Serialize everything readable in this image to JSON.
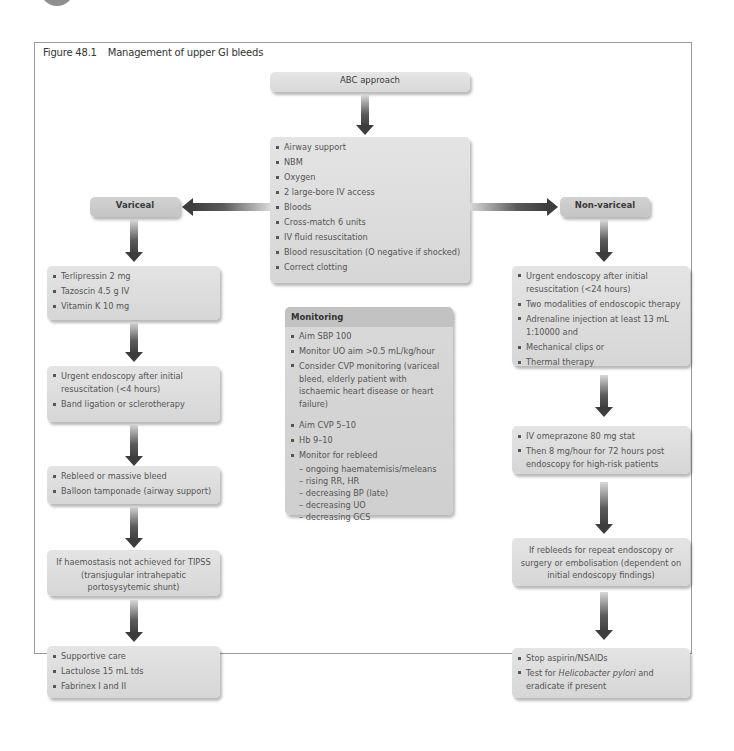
{
  "figure": {
    "number": "Figure 48.1",
    "title": "Management of upper GI bleeds"
  },
  "abc": {
    "title": "ABC approach",
    "items": [
      "Airway support",
      "NBM",
      "Oxygen",
      "2 large-bore IV access",
      "Bloods",
      "Cross-match 6 units",
      "IV fluid resuscitation",
      "Blood resuscitation (O negative if shocked)",
      "Correct clotting"
    ]
  },
  "variceal": {
    "title": "Variceal",
    "step1": [
      "Terlipressin 2 mg",
      "Tazoscin 4.5 g IV",
      "Vitamin K 10 mg"
    ],
    "step2": [
      "Urgent endoscopy after initial resuscitation (<4 hours)",
      "Band ligation or sclerotherapy"
    ],
    "step3": [
      "Rebleed or massive bleed",
      "Balloon tamponade (airway support)"
    ],
    "step4": "If haemostasis not achieved for TIPSS (transjugular intrahepatic portosysytemic shunt)",
    "step5": [
      "Supportive care",
      "Lactulose 15 mL tds",
      "Fabrinex I and II"
    ]
  },
  "monitoring": {
    "title": "Monitoring",
    "items": [
      "Aim SBP 100",
      "Monitor UO aim >0.5 mL/kg/hour",
      "Consider CVP monitoring (variceal bleed, elderly patient with ischaemic heart disease or heart failure)",
      "Aim CVP 5–10",
      "Hb 9–10",
      "Monitor for rebleed"
    ],
    "rebleed_signs": [
      "– ongoing haematemisis/meleans",
      "– rising RR, HR",
      "– decreasing BP (late)",
      "– decreasing UO",
      "– decreasing GCS"
    ]
  },
  "non_variceal": {
    "title": "Non-variceal",
    "step1": [
      "Urgent endoscopy after initial resuscitation (<24 hours)",
      "Two modalities of endoscopic therapy",
      "Adrenaline injection at least 13 mL 1:10000 and",
      "Mechanical clips or",
      "Thermal therapy"
    ],
    "step2": [
      "IV omeprazone 80 mg stat",
      "Then 8 mg/hour for 72 hours post endoscopy for high-risk patients"
    ],
    "step3": "If rebleeds for repeat endoscopy or surgery or embolisation (dependent on initial endoscopy findings)",
    "step4": {
      "item1": "Stop aspirin/NSAIDs",
      "item2_prefix": "Test for ",
      "item2_italic": "Helicobacter pylori",
      "item2_suffix": " and eradicate if present"
    }
  }
}
